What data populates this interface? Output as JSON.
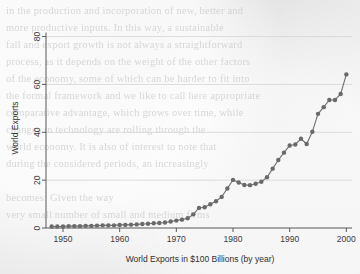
{
  "page": {
    "background_color": "#ececec",
    "bleed_through_text": "in the production and incorporation of new, better and\nmore productive inputs. In this way, a sustainable\nfall and export growth is not always a straightforward\nprocess, as it depends on the weight of the other factors\nof the economy, some of which can be harder to fit into\nthe formal framework and we like to call here appropriate\ncomparative advantage, which grows over time, while\nchanges in technology are rolling through the\nworld economy. It is also of interest to note that\nduring the considered periods, an increasingly\n\nbecomes: Given the way\nvery small number of small and medium firms"
  },
  "chart_data": {
    "type": "line",
    "title": "",
    "subtitle": "",
    "xlabel": "World Exports in $100 Billions (by year)",
    "ylabel": "World Exports",
    "xlim": [
      1947,
      2001
    ],
    "ylim": [
      0,
      84
    ],
    "xticks": [
      1950,
      1960,
      1970,
      1980,
      1990,
      2000
    ],
    "yticks": [
      0,
      20,
      40,
      60,
      80
    ],
    "grid": true,
    "grid_axis": "y",
    "legend": null,
    "legend_position": "none",
    "marker": "circle",
    "marker_color": "#6a6a6a",
    "line_color": "#6f6f6f",
    "series": [
      {
        "name": "World Exports",
        "x": [
          1948,
          1949,
          1950,
          1951,
          1952,
          1953,
          1954,
          1955,
          1956,
          1957,
          1958,
          1959,
          1960,
          1961,
          1962,
          1963,
          1964,
          1965,
          1966,
          1967,
          1968,
          1969,
          1970,
          1971,
          1972,
          1973,
          1974,
          1975,
          1976,
          1977,
          1978,
          1979,
          1980,
          1981,
          1982,
          1983,
          1984,
          1985,
          1986,
          1987,
          1988,
          1989,
          1990,
          1991,
          1992,
          1993,
          1994,
          1995,
          1996,
          1997,
          1998,
          1999,
          2000
        ],
        "values": [
          0.6,
          0.6,
          0.6,
          0.8,
          0.8,
          0.8,
          0.9,
          0.9,
          1.0,
          1.1,
          1.1,
          1.1,
          1.3,
          1.3,
          1.4,
          1.5,
          1.7,
          1.8,
          2.0,
          2.1,
          2.3,
          2.7,
          3.1,
          3.5,
          4.1,
          5.7,
          8.4,
          8.7,
          9.9,
          11.2,
          13.0,
          16.5,
          20.1,
          19.0,
          18.0,
          17.9,
          18.5,
          19.3,
          21.2,
          24.8,
          28.4,
          31.5,
          34.5,
          34.9,
          37.3,
          35.1,
          40.2,
          47.7,
          50.5,
          53.5,
          53.5,
          56.0,
          64.2
        ]
      }
    ]
  }
}
